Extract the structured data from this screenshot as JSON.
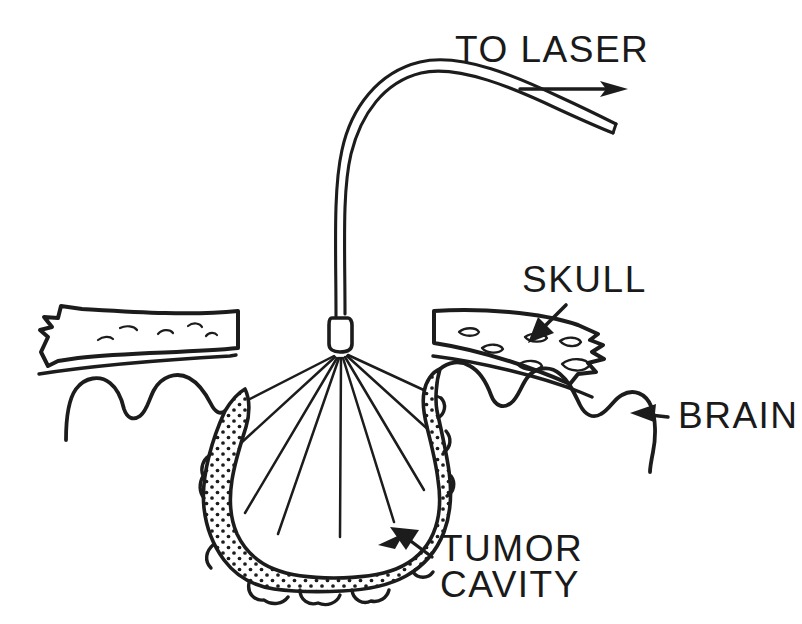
{
  "figure": {
    "background_color": "#ffffff",
    "ink_color": "#1c1c1c",
    "width": 802,
    "height": 624
  },
  "labels": {
    "to_laser": "TO LASER",
    "skull": "SKULL",
    "brain": "BRAIN",
    "tumor_cavity_line1": "TUMOR",
    "tumor_cavity_line2": "CAVITY"
  },
  "annotations": {
    "to_laser_arrow": "arrow-right",
    "skull_arrow": "arrow-down-left",
    "brain_arrow": "arrow-left",
    "tumor_arrow": "arrow-up-left"
  },
  "parts": {
    "optical_fiber": "optical-fiber",
    "fiber_tip": "diffuser-tip",
    "light_rays_count": 9,
    "skull_left": "skull-bone-left",
    "skull_right": "skull-bone-right",
    "dura_left": "dura-line-left",
    "dura_right": "dura-line-right",
    "brain_left": "brain-gyri-left",
    "brain_right": "brain-gyri-right",
    "tumor_rim": "tumor-cavity-stippled-rim",
    "cavity_interior": "resection-cavity"
  }
}
